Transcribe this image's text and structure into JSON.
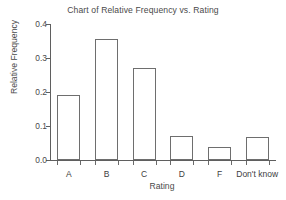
{
  "chart_data": {
    "type": "bar",
    "title": "Chart of Relative Frequency vs. Rating",
    "xlabel": "Rating",
    "ylabel": "Relative Frequency",
    "categories": [
      "A",
      "B",
      "C",
      "D",
      "F",
      "Don't know"
    ],
    "values": [
      0.191,
      0.355,
      0.271,
      0.07,
      0.038,
      0.067
    ],
    "ylim": [
      0.0,
      0.4
    ],
    "ytick_labels": [
      "0.0",
      "0.1",
      "0.2",
      "0.3",
      "0.4"
    ],
    "ytick_values": [
      0.0,
      0.1,
      0.2,
      0.3,
      0.4
    ],
    "grid": false,
    "legend": "none",
    "bar_fill_color": "#ffffff",
    "bar_edge_color": "#6e6e6e",
    "axis_color": "#5f5f5f",
    "text_color": "#4a4a4a",
    "background_color": "#ffffff"
  }
}
